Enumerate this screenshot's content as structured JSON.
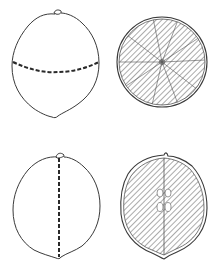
{
  "figure": {
    "panels": [
      {
        "id": "whole-fruit-horizontal-cut",
        "cut": "horizontal dashed line (transverse)"
      },
      {
        "id": "transverse-section",
        "view": "cross-section with radial segments, hatched"
      },
      {
        "id": "whole-fruit-vertical-cut",
        "cut": "vertical dashed line (longitudinal)"
      },
      {
        "id": "longitudinal-section",
        "view": "lengthwise section with central axis and seeds, hatched"
      }
    ],
    "colors": {
      "line": "#3a3a3a",
      "hatch": "#444444",
      "background": "#ffffff"
    }
  }
}
